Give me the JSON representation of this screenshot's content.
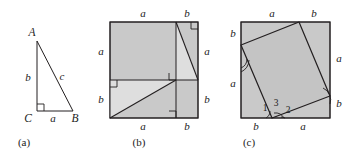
{
  "figure": {
    "background_color": "#ffffff",
    "stroke_color": "#231f20",
    "fill_color": "#c9c9c9",
    "panels": [
      {
        "id": "a",
        "caption": "(a)",
        "kind": "right-triangle",
        "vertices": {
          "A": "A",
          "B": "B",
          "C": "C"
        },
        "sides": {
          "leg_vertical": "b",
          "leg_horizontal": "a",
          "hypotenuse": "c"
        }
      },
      {
        "id": "b",
        "caption": "(b)",
        "kind": "dissected-square",
        "edge_labels": {
          "top_left": "a",
          "top_right": "b",
          "right_upper": "a",
          "right_lower": "b",
          "bottom_left": "a",
          "bottom_right": "b"
        }
      },
      {
        "id": "c",
        "caption": "(c)",
        "kind": "inscribed-tilted-square",
        "edge_labels": {
          "top_left": "a",
          "top_right": "b",
          "left_upper": "b",
          "left_lower": "a",
          "right_upper": "a",
          "right_lower": "b",
          "bottom_left": "b",
          "bottom_right": "a"
        },
        "angle_labels": [
          "1",
          "2",
          "3"
        ]
      }
    ]
  }
}
